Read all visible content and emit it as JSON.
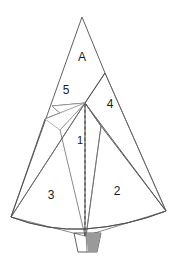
{
  "figure": {
    "canvas": {
      "width": 176,
      "height": 259,
      "background": "#ffffff"
    },
    "palette": {
      "dark_gray": "#808080",
      "mid_gray": "#b3b3b3",
      "light_gray": "#d8d8d8",
      "pale_gray": "#ededed",
      "near_white": "#f6f6f6",
      "white": "#ffffff",
      "outline": "#4d4d4d",
      "label_text": "#1a1a1a",
      "stem_fill": "#a8a8a8"
    },
    "labels": [
      {
        "id": "label-a",
        "text": "A",
        "x": 82,
        "y": 58,
        "size": "big"
      },
      {
        "id": "label-5",
        "text": "5",
        "x": 66,
        "y": 91,
        "size": "big"
      },
      {
        "id": "label-4",
        "text": "4",
        "x": 110,
        "y": 105,
        "size": "big"
      },
      {
        "id": "label-1",
        "text": "1",
        "x": 80,
        "y": 141,
        "size": "normal"
      },
      {
        "id": "label-3",
        "text": "3",
        "x": 51,
        "y": 196,
        "size": "big"
      },
      {
        "id": "label-2",
        "text": "2",
        "x": 117,
        "y": 192,
        "size": "big"
      }
    ],
    "regions": [
      {
        "id": "region-fan-body",
        "name": "fan-body",
        "label": "3",
        "fill": "#ffffff",
        "points": "11,217 85,103 166,211 128,223 85,228 42,224"
      },
      {
        "id": "region-4-wedge",
        "name": "wedge-4",
        "label": "4",
        "fill": "#f6f6f6",
        "points": "105,73 166,211 101,126 85,103"
      },
      {
        "id": "region-center-sliver",
        "name": "center-sliver",
        "label": "1",
        "fill": "#d8d8d8",
        "points": "85,103 101,126 86,236 85,236"
      },
      {
        "id": "region-a-triangle",
        "name": "triangle-A",
        "label": "A",
        "fill": "#808080",
        "points": "82,17 105,73 85,103 11,217 45,118 60,112 52,106"
      },
      {
        "id": "region-stem",
        "name": "stem-base",
        "label": "",
        "fill": "#a8a8a8",
        "points": "74,232 101,232 97,252 78,252"
      }
    ],
    "fold_line": {
      "id": "fold-dashed",
      "name": "center-fold",
      "style": "dashed",
      "points": "85,103 85,237"
    }
  }
}
